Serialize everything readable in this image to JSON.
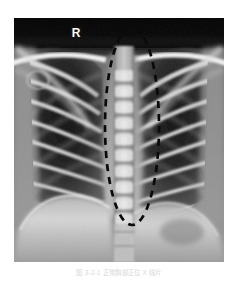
{
  "figure": {
    "modality": "chest-radiograph",
    "view": "posteroanterior",
    "caption": "图 3-2-1  正常胸部正位 X 线片",
    "caption_color": "#d8d8d8",
    "background_color": "#ffffff",
    "frame": {
      "x": 14,
      "y": 18,
      "width": 210,
      "height": 244
    }
  },
  "markers": {
    "side_marker": {
      "label": "R",
      "meaning": "right-side-marker",
      "x": 74,
      "y": 31,
      "color": "#ffffff"
    }
  },
  "annotation": {
    "shape": "dashed-ellipse",
    "semantic": "mediastinum-highlight",
    "color": "#0a0a0a",
    "stroke_width": 2.6,
    "dash_pattern": "7 6",
    "center_x": 132,
    "center_y": 126,
    "radius_x": 27,
    "radius_y": 99
  },
  "anatomy": {
    "lung_field_left": {
      "label": "left-lung-field",
      "tone": "#262626"
    },
    "lung_field_right": {
      "label": "right-lung-field",
      "tone": "#2b2b2b"
    },
    "spine": {
      "label": "thoracic-spine",
      "tone": "#c8c8c8",
      "vertebra_count": 11
    },
    "clavicle_left": {
      "label": "left-clavicle",
      "tone": "#e8e8e8"
    },
    "clavicle_right": {
      "label": "right-clavicle",
      "tone": "#e8e8e8"
    },
    "scapula_left": {
      "label": "left-scapula",
      "tone": "#b4b4b4"
    },
    "scapula_right": {
      "label": "right-scapula",
      "tone": "#b4b4b4"
    },
    "diaphragm_left": {
      "label": "left-hemidiaphragm",
      "tone": "#d4d4d4"
    },
    "diaphragm_right": {
      "label": "right-hemidiaphragm",
      "tone": "#dcdcdc"
    },
    "ribs": {
      "label": "rib-cage",
      "tone": "#9a9a9a",
      "pairs": 9
    },
    "apex_band": {
      "label": "supraclavicular-air-band",
      "tone": "#050505"
    },
    "trachea": {
      "label": "trachea",
      "tone": "#1e1e1e"
    }
  },
  "tones": {
    "film_black": "#050505",
    "lung_dark": "#242424",
    "soft_tissue": "#8a8a8a",
    "bone_bright": "#e6e6e6",
    "diaphragm": "#d0d0d0",
    "annotation_black": "#0a0a0a"
  }
}
